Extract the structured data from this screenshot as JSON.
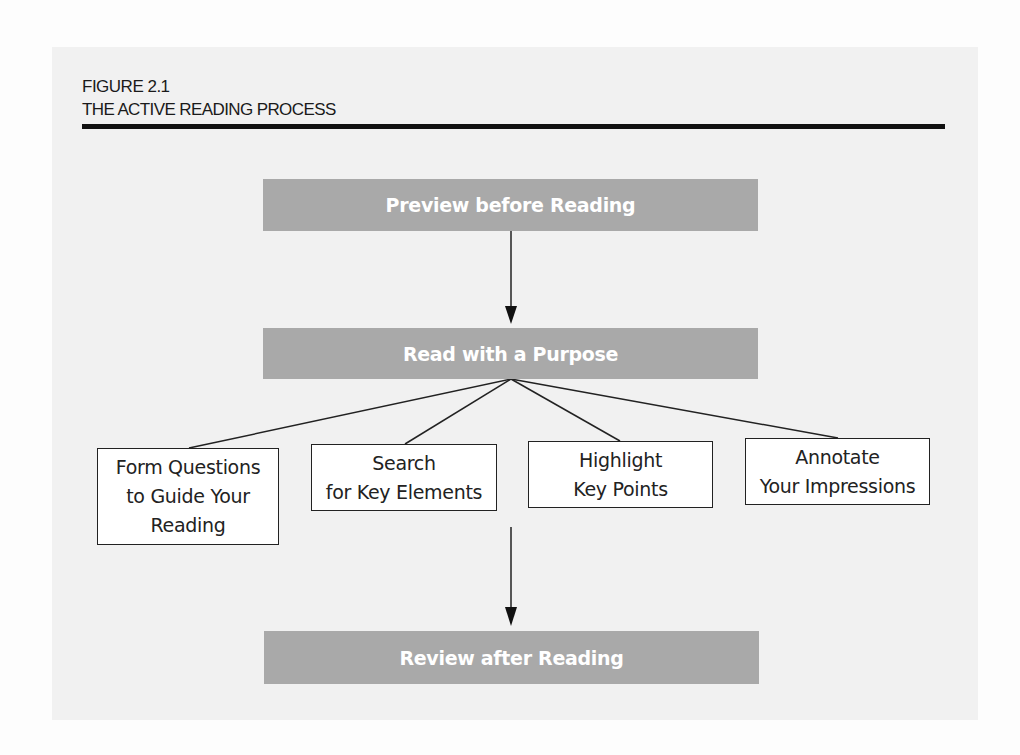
{
  "figure": {
    "label": "FIGURE 2.1",
    "title": "THE ACTIVE READING PROCESS"
  },
  "steps": {
    "preview": "Preview before Reading",
    "read": "Read with a Purpose",
    "review": "Review after Reading"
  },
  "substeps": [
    {
      "lines": [
        "Form Questions",
        "to Guide Your",
        "Reading"
      ]
    },
    {
      "lines": [
        "Search",
        "for Key Elements"
      ]
    },
    {
      "lines": [
        "Highlight",
        "Key Points"
      ]
    },
    {
      "lines": [
        "Annotate",
        "Your Impressions"
      ]
    }
  ],
  "colors": {
    "step_fill": "#a9a9a9",
    "step_text": "#ffffff",
    "substep_border": "#222222",
    "rule": "#111111"
  }
}
